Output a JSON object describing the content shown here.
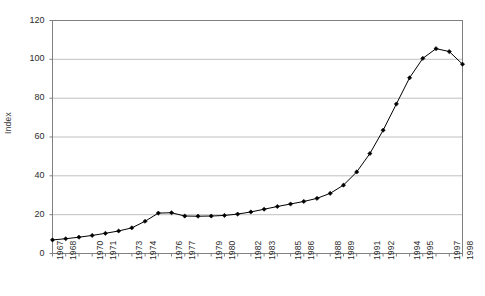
{
  "chart_data": {
    "type": "line",
    "title": "",
    "subtitle": "",
    "xlabel": "",
    "ylabel": "Index",
    "xlim": [
      1967,
      1998
    ],
    "ylim": [
      0,
      120
    ],
    "y_ticks": [
      0,
      20,
      40,
      60,
      80,
      100,
      120
    ],
    "grid": "horizontal",
    "legend": "none",
    "marker": "filled-diamond",
    "line_color": "#000000",
    "marker_color": "#000000",
    "gridline_color": "#c0c0c0",
    "axis_color": "#808080",
    "plot_background": "#ffffff",
    "x_tick_labels": [
      "1967",
      "1968",
      "1970",
      "1971",
      "1973",
      "1974",
      "1976",
      "1977",
      "1979",
      "1980",
      "1982",
      "1983",
      "1985",
      "1986",
      "1988",
      "1989",
      "1991",
      "1992",
      "1994",
      "1995",
      "1997",
      "1998"
    ],
    "x": [
      1967,
      1968,
      1969,
      1970,
      1971,
      1972,
      1973,
      1974,
      1975,
      1976,
      1977,
      1978,
      1979,
      1980,
      1981,
      1982,
      1983,
      1984,
      1985,
      1986,
      1987,
      1988,
      1989,
      1990,
      1991,
      1992,
      1993,
      1994,
      1995,
      1996,
      1997,
      1998
    ],
    "series": [
      {
        "name": "Index",
        "values": [
          7.0,
          7.6,
          8.4,
          9.3,
          10.4,
          11.6,
          13.2,
          16.6,
          20.8,
          21.0,
          19.3,
          19.2,
          19.3,
          19.6,
          20.3,
          21.4,
          22.8,
          24.2,
          25.5,
          26.8,
          28.4,
          31.0,
          35.2,
          42.0,
          51.5,
          63.5,
          77.0,
          90.5,
          100.5,
          105.5,
          104.0,
          97.5
        ]
      }
    ],
    "values_full": [
      {
        "x": 1967,
        "y": 7.0
      },
      {
        "x": 1968,
        "y": 7.6
      },
      {
        "x": 1969,
        "y": 8.4
      },
      {
        "x": 1970,
        "y": 9.3
      },
      {
        "x": 1971,
        "y": 10.4
      },
      {
        "x": 1972,
        "y": 11.6
      },
      {
        "x": 1973,
        "y": 13.2
      },
      {
        "x": 1974,
        "y": 16.6
      },
      {
        "x": 1975,
        "y": 20.8
      },
      {
        "x": 1976,
        "y": 21.0
      },
      {
        "x": 1977,
        "y": 19.3
      },
      {
        "x": 1978,
        "y": 19.2
      },
      {
        "x": 1979,
        "y": 19.3
      },
      {
        "x": 1980,
        "y": 19.6
      },
      {
        "x": 1981,
        "y": 20.3
      },
      {
        "x": 1982,
        "y": 21.4
      },
      {
        "x": 1983,
        "y": 22.8
      },
      {
        "x": 1984,
        "y": 24.2
      },
      {
        "x": 1985,
        "y": 25.5
      },
      {
        "x": 1986,
        "y": 26.8
      },
      {
        "x": 1987,
        "y": 28.4
      },
      {
        "x": 1988,
        "y": 31.0
      },
      {
        "x": 1989,
        "y": 35.2
      },
      {
        "x": 1990,
        "y": 42.0
      },
      {
        "x": 1991,
        "y": 51.5
      },
      {
        "x": 1992,
        "y": 63.5
      },
      {
        "x": 1993,
        "y": 77.0
      },
      {
        "x": 1994,
        "y": 90.5
      },
      {
        "x": 1995,
        "y": 100.5
      },
      {
        "x": 1996,
        "y": 105.5
      },
      {
        "x": 1997,
        "y": 104.0
      },
      {
        "x": 1998,
        "y": 97.5
      }
    ]
  },
  "axis": {
    "y_label": "Index",
    "y_ticks": [
      "0",
      "20",
      "40",
      "60",
      "80",
      "100",
      "120"
    ]
  }
}
